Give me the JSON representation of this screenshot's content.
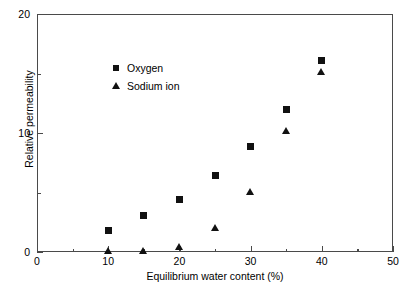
{
  "chart_data": {
    "type": "scatter",
    "title": "",
    "xlabel": "Equilibrium water content (%)",
    "ylabel": "Relative permeability",
    "xlim": [
      0,
      50
    ],
    "ylim": [
      0,
      20
    ],
    "xticks": [
      0,
      10,
      20,
      30,
      40,
      50
    ],
    "xticklabels": [
      "0",
      "10",
      "20",
      "30",
      "40",
      "50"
    ],
    "xminorticks": [
      5,
      15,
      25,
      35,
      45
    ],
    "yticks": [
      0,
      10,
      20
    ],
    "yticklabels": [
      "0",
      "10",
      "20"
    ],
    "yminorticks": [
      5,
      15
    ],
    "grid": false,
    "legend_position": "upper-left-inside",
    "series": [
      {
        "name": "Oxygen",
        "marker": "square",
        "color": "#111111",
        "x": [
          10,
          15,
          20,
          25,
          30,
          35,
          40
        ],
        "y": [
          1.8,
          3.1,
          4.4,
          6.4,
          8.9,
          12.0,
          16.1
        ]
      },
      {
        "name": "Sodium ion",
        "marker": "triangle",
        "color": "#111111",
        "x": [
          10,
          15,
          20,
          25,
          30,
          35,
          40
        ],
        "y": [
          0.0,
          0.0,
          0.4,
          2.0,
          5.0,
          10.1,
          15.1
        ]
      }
    ]
  },
  "legend": {
    "items": [
      {
        "label": "Oxygen",
        "marker": "square"
      },
      {
        "label": "Sodium ion",
        "marker": "triangle"
      }
    ]
  },
  "colors": {
    "marker": "#111111",
    "axis": "#4a4a4a",
    "background": "#ffffff"
  }
}
